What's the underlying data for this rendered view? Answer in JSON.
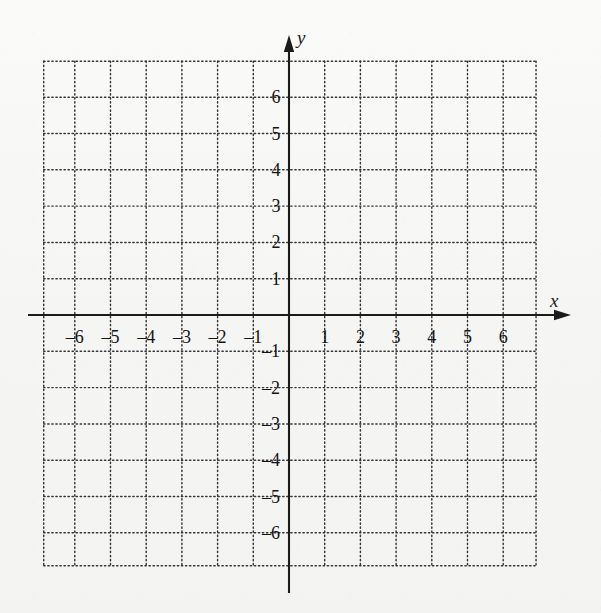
{
  "figure": {
    "kind": "cartesian-coordinate-grid",
    "background_color": "#f6f6f4",
    "ink_color": "#1b1b1b",
    "grid_color": "#3a3a3a"
  },
  "axes": {
    "x_axis": {
      "label": "x",
      "label_style": "italic",
      "arrow": "right",
      "origin_px": 289,
      "pixels_per_unit": 35.7,
      "tick_labels": [
        "–6",
        "–5",
        "–4",
        "–3",
        "–2",
        "–1",
        "1",
        "2",
        "3",
        "4",
        "5",
        "6"
      ],
      "tick_values": [
        -6,
        -5,
        -4,
        -3,
        -2,
        -1,
        1,
        2,
        3,
        4,
        5,
        6
      ],
      "range": [
        -6.9,
        6.9
      ]
    },
    "y_axis": {
      "label": "y",
      "label_style": "italic",
      "arrow": "up",
      "origin_px": 315,
      "pixels_per_unit": 36.3,
      "tick_labels": [
        "6",
        "5",
        "4",
        "3",
        "2",
        "1",
        "–1",
        "–2",
        "–3",
        "–4",
        "–5",
        "–6"
      ],
      "tick_values": [
        6,
        5,
        4,
        3,
        2,
        1,
        -1,
        -2,
        -3,
        -4,
        -5,
        -6
      ],
      "range": [
        -7.0,
        7.2
      ]
    }
  },
  "grid": {
    "style": "dotted",
    "dot_spacing_px": 4,
    "dot_radius_px": 0.65,
    "x_lines": [
      -6,
      -5,
      -4,
      -3,
      -2,
      -1,
      0,
      1,
      2,
      3,
      4,
      5,
      6
    ],
    "y_lines": [
      -6,
      -5,
      -4,
      -3,
      -2,
      -1,
      0,
      1,
      2,
      3,
      4,
      5,
      6
    ],
    "bounds_units": {
      "left": -6.87,
      "right": 6.92,
      "top": 6.99,
      "bottom": -6.91
    }
  },
  "chart_data": {
    "type": "scatter",
    "title": "",
    "subtitle": "",
    "xlabel": "x",
    "ylabel": "y",
    "xlim": [
      -6.87,
      6.92
    ],
    "ylim": [
      -6.91,
      6.99
    ],
    "xticks": [
      -6,
      -5,
      -4,
      -3,
      -2,
      -1,
      1,
      2,
      3,
      4,
      5,
      6
    ],
    "yticks": [
      -6,
      -5,
      -4,
      -3,
      -2,
      -1,
      1,
      2,
      3,
      4,
      5,
      6
    ],
    "xticklabels": [
      "–6",
      "–5",
      "–4",
      "–3",
      "–2",
      "–1",
      "1",
      "2",
      "3",
      "4",
      "5",
      "6"
    ],
    "yticklabels": [
      "–6",
      "–5",
      "–4",
      "–3",
      "–2",
      "–1",
      "1",
      "2",
      "3",
      "4",
      "5",
      "6"
    ],
    "grid": true,
    "grid_style": "dotted",
    "legend": null,
    "legend_position": "none",
    "series": [],
    "points": [],
    "annotations": [],
    "note": "Empty graph paper: axes and dotted unit grid only, no plotted data."
  }
}
